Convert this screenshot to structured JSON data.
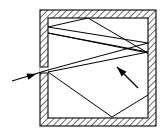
{
  "figure": {
    "type": "line-diagram",
    "background_color": "#ffffff",
    "stroke_color": "#000000",
    "wall_fill_color": "#ffffff",
    "wall_hatch_color": "#000000",
    "interior_fill_color": "#ffffff",
    "canvas": {
      "width": 164,
      "height": 134
    }
  },
  "enclosure": {
    "name": "cavity-box",
    "outer": {
      "x": 40,
      "y": 10,
      "width": 116,
      "height": 116
    },
    "inner": {
      "x": 48,
      "y": 18,
      "width": 100,
      "height": 100
    },
    "wall_thickness": 8,
    "hatch_angle_deg": 45,
    "hatch_spacing": 3.2,
    "hatch_line_width": 0.9
  },
  "aperture": {
    "name": "entrance-hole",
    "wall": "left",
    "x": 40,
    "y_top": 67,
    "y_bottom": 73,
    "width": 8,
    "height": 6
  },
  "incoming_ray": {
    "name": "incident-ray",
    "from": {
      "x": 12,
      "y": 81
    },
    "to": {
      "x": 48,
      "y": 70
    },
    "arrowhead": {
      "x": 36,
      "y": 74,
      "angle_deg": 343
    },
    "line_width": 1.2
  },
  "ray_path": {
    "name": "internal-ray-path",
    "line_width": 1.0,
    "vertices": [
      {
        "x": 48,
        "y": 70,
        "label": "aperture-entry"
      },
      {
        "x": 148,
        "y": 43,
        "label": "right-wall-bounce-1"
      },
      {
        "x": 48,
        "y": 27,
        "label": "left-wall-bounce-1"
      },
      {
        "x": 88,
        "y": 18,
        "label": "top-wall-bounce"
      },
      {
        "x": 148,
        "y": 53,
        "label": "right-wall-bounce-2"
      },
      {
        "x": 48,
        "y": 33,
        "label": "left-wall-bounce-2"
      },
      {
        "x": 148,
        "y": 52,
        "label": "right-wall-bounce-3"
      },
      {
        "x": 48,
        "y": 72,
        "label": "left-wall-bounce-3"
      },
      {
        "x": 112,
        "y": 117,
        "label": "bottom-wall-bounce"
      },
      {
        "x": 148,
        "y": 95,
        "label": "right-wall-bounce-4"
      }
    ]
  },
  "direction_arrow": {
    "name": "ray-direction-indicator",
    "from": {
      "x": 138,
      "y": 88
    },
    "to": {
      "x": 117,
      "y": 67
    },
    "arrowhead": {
      "x": 117,
      "y": 67,
      "angle_deg": 225
    },
    "line_width": 1.2
  }
}
